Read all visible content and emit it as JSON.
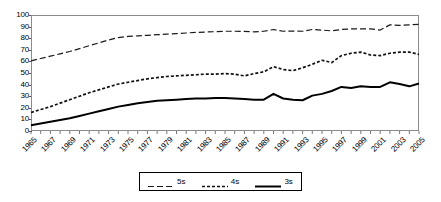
{
  "chart_data": {
    "type": "line",
    "title": "",
    "xlabel": "",
    "ylabel": "",
    "ylim": [
      0,
      100
    ],
    "ytick_step": 10,
    "yticks": [
      100,
      90,
      80,
      70,
      60,
      50,
      40,
      30,
      20,
      10,
      0
    ],
    "grid": false,
    "legend_position": "bottom",
    "x": [
      1965,
      1966,
      1967,
      1968,
      1969,
      1970,
      1971,
      1972,
      1973,
      1974,
      1975,
      1976,
      1977,
      1978,
      1979,
      1980,
      1981,
      1982,
      1983,
      1984,
      1985,
      1986,
      1987,
      1988,
      1989,
      1990,
      1991,
      1992,
      1993,
      1994,
      1995,
      1996,
      1997,
      1998,
      1999,
      2000,
      2001,
      2002,
      2003,
      2004,
      2005
    ],
    "xtick_labels": [
      "1965",
      "1967",
      "1969",
      "1971",
      "1973",
      "1975",
      "1977",
      "1979",
      "1981",
      "1983",
      "1985",
      "1987",
      "1989",
      "1991",
      "1993",
      "1995",
      "1997",
      "1999",
      "2001",
      "2003",
      "2005"
    ],
    "series": [
      {
        "name": "5s",
        "style": "long-dash",
        "color": "#1a1a1a",
        "values": [
          60.5,
          62.5,
          64.5,
          66.5,
          68.5,
          71.0,
          73.5,
          76.0,
          78.5,
          80.5,
          81.5,
          82.0,
          82.5,
          83.0,
          83.5,
          84.0,
          84.5,
          85.0,
          85.3,
          85.6,
          86.0,
          86.0,
          85.8,
          85.5,
          86.0,
          87.5,
          86.0,
          86.2,
          86.0,
          87.5,
          87.0,
          86.3,
          87.5,
          88.0,
          88.0,
          88.0,
          87.0,
          91.5,
          91.0,
          91.5,
          92.0
        ]
      },
      {
        "name": "4s",
        "style": "short-dash",
        "color": "#111111",
        "values": [
          16.0,
          18.5,
          21.0,
          24.0,
          27.0,
          30.0,
          33.0,
          35.5,
          38.0,
          40.5,
          42.0,
          43.5,
          45.0,
          46.0,
          47.0,
          47.5,
          48.0,
          48.5,
          49.0,
          49.0,
          49.5,
          49.0,
          47.5,
          49.5,
          51.0,
          55.5,
          53.0,
          52.0,
          54.5,
          57.5,
          61.0,
          59.0,
          65.0,
          67.0,
          68.0,
          65.5,
          65.0,
          67.0,
          68.0,
          68.0,
          66.0
        ]
      },
      {
        "name": "3s",
        "style": "solid",
        "color": "#000000",
        "values": [
          5.0,
          6.5,
          8.0,
          9.5,
          11.0,
          13.0,
          15.0,
          17.0,
          19.0,
          21.0,
          22.5,
          24.0,
          25.0,
          26.0,
          26.5,
          27.0,
          27.5,
          28.0,
          28.0,
          28.5,
          28.5,
          28.0,
          27.5,
          27.0,
          27.0,
          32.0,
          28.0,
          27.0,
          26.5,
          30.5,
          32.0,
          34.5,
          38.0,
          37.0,
          38.5,
          38.0,
          38.0,
          42.0,
          40.5,
          38.5,
          41.0
        ]
      }
    ]
  },
  "legend": {
    "items": [
      {
        "label": "5s"
      },
      {
        "label": "4s"
      },
      {
        "label": "3s"
      }
    ]
  }
}
